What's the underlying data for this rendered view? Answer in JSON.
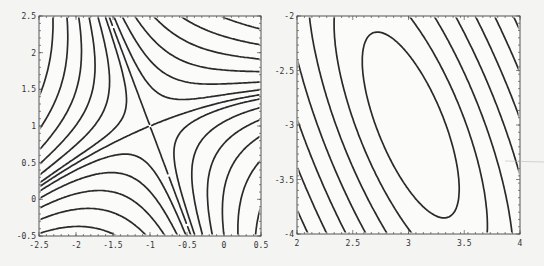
{
  "chart_data": [
    {
      "type": "contour",
      "title": "",
      "xlabel": "",
      "ylabel": "",
      "xlim": [
        -2.5,
        0.5
      ],
      "ylim": [
        -0.5,
        2.5
      ],
      "x_ticks": [
        -2.5,
        -2,
        -1.5,
        -1,
        -0.5,
        0,
        0.5
      ],
      "x_tick_labels": [
        "-2.5",
        "-2",
        "-1.5",
        "-1",
        "-0.5",
        "0",
        "0.5"
      ],
      "y_ticks": [
        -0.5,
        0,
        0.5,
        1,
        1.5,
        2,
        2.5
      ],
      "y_tick_labels": [
        "-0.5",
        "0",
        "0.5",
        "1",
        "1.5",
        "2",
        "2.5"
      ],
      "feature": "saddle point at approximately (-1, 1)",
      "function": {
        "kind": "saddle",
        "cx": -1,
        "cy": 1,
        "m1": -2.7,
        "m2": 0.42,
        "curv": -0.09
      },
      "levels": [
        -6,
        -4.5,
        -3.2,
        -2.2,
        -1.4,
        -0.75,
        -0.25,
        0,
        0.3,
        0.8,
        1.5,
        2.4,
        3.5,
        4.8,
        6.3,
        8
      ]
    },
    {
      "type": "contour",
      "title": "",
      "xlabel": "",
      "ylabel": "",
      "xlim": [
        2,
        4
      ],
      "ylim": [
        -4,
        -2
      ],
      "x_ticks": [
        2,
        2.5,
        3,
        3.5,
        4
      ],
      "x_tick_labels": [
        "2",
        "2.5",
        "3",
        "3.5",
        "4"
      ],
      "y_ticks": [
        -4,
        -3.5,
        -3,
        -2.5,
        -2
      ],
      "y_tick_labels": [
        "-4",
        "-3.5",
        "-3",
        "-2.5",
        "-2"
      ],
      "feature": "elliptical minimum at approximately (3.0, -3.0)",
      "function": {
        "kind": "quadratic",
        "cx": 3.02,
        "cy": -3.0,
        "a": 10,
        "b": 7,
        "c": 2.6
      },
      "levels": [
        1,
        2.5,
        4.5,
        7,
        10,
        13.5,
        17.5,
        22,
        27,
        32.5,
        38.5,
        45,
        52,
        59.5,
        67.5
      ]
    }
  ]
}
